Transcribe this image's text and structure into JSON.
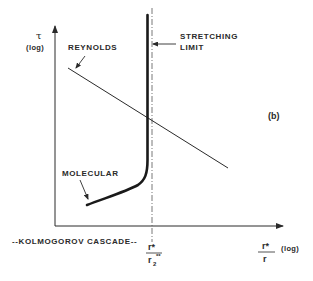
{
  "diagram": {
    "panel_label": "(b)",
    "y_axis": {
      "symbol": "τ",
      "scale": "(log)"
    },
    "x_axis": {
      "numerator": "r*",
      "denominator": "r",
      "scale": "(log)",
      "cascade_label": "--KOLMOGOROV CASCADE--",
      "marker_numerator": "r*",
      "marker_denominator": "r",
      "marker_denominator_sub": "2",
      "marker_denominator_sup": "**"
    },
    "curves": [
      {
        "name": "REYNOLDS",
        "type": "straight line, decreasing"
      },
      {
        "name": "MOLECULAR",
        "type": "thick curve rising into vertical asymptote"
      }
    ],
    "annotations": {
      "reynolds": "REYNOLDS",
      "stretching_line1": "STRETCHING",
      "stretching_line2": "LIMIT",
      "molecular": "MOLECULAR"
    },
    "colors": {
      "ink": "#2a2a2a",
      "background": "#ffffff"
    }
  }
}
